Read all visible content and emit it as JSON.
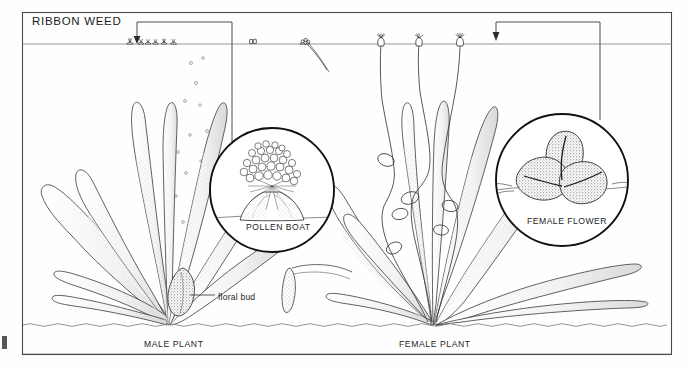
{
  "figure": {
    "title": "RIBBON WEED",
    "background_color": "#fefefe",
    "ink_color": "#1a1a1a",
    "frame": {
      "x": 22,
      "y": 12,
      "width": 650,
      "height": 343
    }
  },
  "labels": {
    "title": "RIBBON WEED",
    "pollen_boat": "POLLEN BOAT",
    "female_flower": "FEMALE FLOWER",
    "floral_bud": "floral bud",
    "male_plant": "MALE PLANT",
    "female_plant": "FEMALE PLANT"
  },
  "scene": {
    "water_surface_y": 44,
    "seabed_y": 325,
    "male_plant": {
      "base_x": 168,
      "base_y": 325,
      "leaf_count": 9,
      "has_floral_bud": true,
      "releases_pollen_bubbles": true,
      "bubble_count": 12
    },
    "female_plant": {
      "base_x": 432,
      "base_y": 325,
      "leaf_count": 10,
      "coiled_stalk_count": 3,
      "flowers_at_surface": 3
    },
    "floating_pollen_boats": {
      "count": 6,
      "x_start": 128,
      "x_end": 178,
      "y": 44
    }
  },
  "detail_circles": [
    {
      "name": "pollen-boat",
      "label": "POLLEN BOAT",
      "cx": 272,
      "cy": 190,
      "r": 62,
      "leader_from_x": 232,
      "leader_to_x": 137,
      "leader_top_y": 22
    },
    {
      "name": "female-flower",
      "label": "FEMALE FLOWER",
      "cx": 562,
      "cy": 180,
      "r": 66,
      "leader_from_x": 562,
      "leader_to_x": 496,
      "leader_top_y": 22
    }
  ]
}
